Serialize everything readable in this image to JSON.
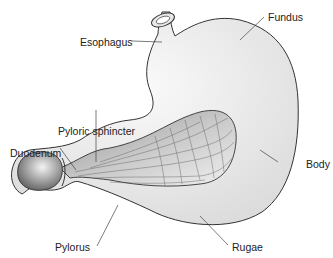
{
  "diagram": {
    "labels": {
      "esophagus": "Esophagus",
      "fundus": "Fundus",
      "pyloric_sphincter": "Pyloric sphincter",
      "duodenum": "Duodenum",
      "body": "Body",
      "pylorus": "Pylorus",
      "rugae": "Rugae"
    },
    "colors": {
      "outline": "#333333",
      "fill": "#eeeeee",
      "interior": "#b0b0b0",
      "leader": "#444444"
    }
  }
}
